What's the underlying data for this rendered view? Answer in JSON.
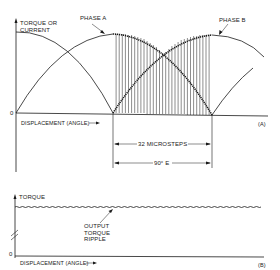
{
  "panel_a": {
    "y_axis_label_line1": "TORQUE OR",
    "y_axis_label_line2": "CURRENT",
    "zero_label": "0",
    "x_axis_label": "DISPLACEMENT (ANGLE)",
    "phase_a_label": "PHASE A",
    "phase_b_label": "PHASE B",
    "microsteps_label": "32 MICROSTEPS",
    "electrical_angle_label": "90° E",
    "panel_tag": "(a)",
    "microstep_count": 32
  },
  "panel_b": {
    "y_axis_label": "TORQUE",
    "zero_label": "0",
    "x_axis_label": "DISPLACEMENT (ANGLE)",
    "ripple_label_line1": "OUTPUT",
    "ripple_label_line2": "TORQUE",
    "ripple_label_line3": "RIPPLE",
    "panel_tag": "(b)"
  },
  "colors": {
    "ink": "#1a1a1a",
    "background": "#ffffff"
  }
}
